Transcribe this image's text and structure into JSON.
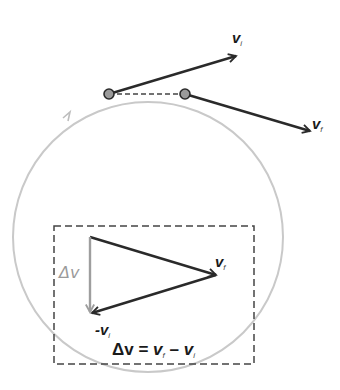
{
  "diagram": {
    "colors": {
      "circle": "#c4c4c4",
      "vector": "#2a2a2a",
      "delta_v": "#9e9e9e",
      "point_fill": "#9a9a9a",
      "dashed": "#444444"
    },
    "labels": {
      "vi_top": {
        "main": "v",
        "sub": "i"
      },
      "vf_top": {
        "main": "v",
        "sub": "f"
      },
      "vf_triangle": {
        "main": "v",
        "sub": "f"
      },
      "neg_vi": {
        "main": "-v",
        "sub": "i"
      },
      "delta_v": "Δv",
      "equation": {
        "lhs": "Δv",
        "eq": " = ",
        "a": "v",
        "a_sub": "f",
        "minus": " – ",
        "b": "v",
        "b_sub": "i"
      }
    },
    "icons": {
      "direction_arrow": "arrow-ccw-on-circle",
      "point_left": "position-dot",
      "point_right": "position-dot"
    }
  }
}
